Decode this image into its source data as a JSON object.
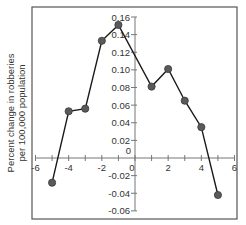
{
  "chart_data": {
    "type": "line",
    "title": "",
    "xlabel": "",
    "ylabel": "Percent change in robberies per 100,000 population",
    "ylabel_lines": [
      "Percent change in robberies",
      "per 100,000 population"
    ],
    "x": [
      -5,
      -4,
      -3,
      -2,
      -1,
      1,
      2,
      3,
      4,
      5
    ],
    "series": [
      {
        "name": "robberies",
        "values": [
          -0.028,
          0.053,
          0.056,
          0.133,
          0.151,
          0.081,
          0.101,
          0.065,
          0.035,
          -0.042
        ]
      }
    ],
    "xlim": [
      -6,
      6
    ],
    "ylim": [
      -0.06,
      0.16
    ],
    "xticks": [
      -6,
      -4,
      -2,
      0,
      2,
      4,
      6
    ],
    "xtick_labels": [
      "-6",
      "-4",
      "-2",
      "0",
      "2",
      "4",
      "6"
    ],
    "yticks": [
      0.16,
      0.14,
      0.12,
      0.1,
      0.08,
      0.06,
      0.04,
      0.02,
      0,
      -0.02,
      -0.04,
      -0.06
    ],
    "ytick_labels": [
      "0.16",
      "0.14",
      "0.12",
      "0.10",
      "0.08",
      "0.06",
      "0.04",
      "0.02",
      "0",
      "-0.02",
      "-0.04",
      "-0.06"
    ],
    "grid": false,
    "legend": null,
    "colors": {
      "line": "#1a1a1a",
      "marker": "#5a5a5a",
      "frame": "#555555",
      "axis": "#777777"
    }
  }
}
